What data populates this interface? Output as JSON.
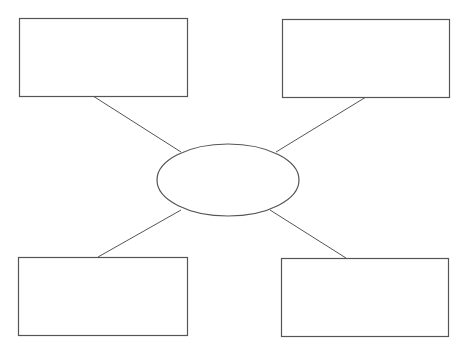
{
  "diagram": {
    "type": "spider-map",
    "stroke_color": "#555555",
    "background": "#ffffff",
    "center": {
      "label": "",
      "shape": "ellipse",
      "cx": 228,
      "cy": 180,
      "rx": 71,
      "ry": 36
    },
    "boxes": [
      {
        "id": "top-left",
        "label": "",
        "x": 19,
        "y": 18,
        "w": 168,
        "h": 78
      },
      {
        "id": "top-right",
        "label": "",
        "x": 282,
        "y": 19,
        "w": 167,
        "h": 78
      },
      {
        "id": "bottom-left",
        "label": "",
        "x": 18,
        "y": 257,
        "w": 169,
        "h": 78
      },
      {
        "id": "bottom-right",
        "label": "",
        "x": 281,
        "y": 258,
        "w": 167,
        "h": 78
      }
    ],
    "connectors": [
      {
        "from": "top-left",
        "x1": 93,
        "y1": 96,
        "x2": 181,
        "y2": 152
      },
      {
        "from": "top-right",
        "x1": 366,
        "y1": 97,
        "x2": 276,
        "y2": 152
      },
      {
        "from": "bottom-left",
        "x1": 98,
        "y1": 257,
        "x2": 181,
        "y2": 210
      },
      {
        "from": "bottom-right",
        "x1": 346,
        "y1": 258,
        "x2": 270,
        "y2": 210
      }
    ]
  }
}
